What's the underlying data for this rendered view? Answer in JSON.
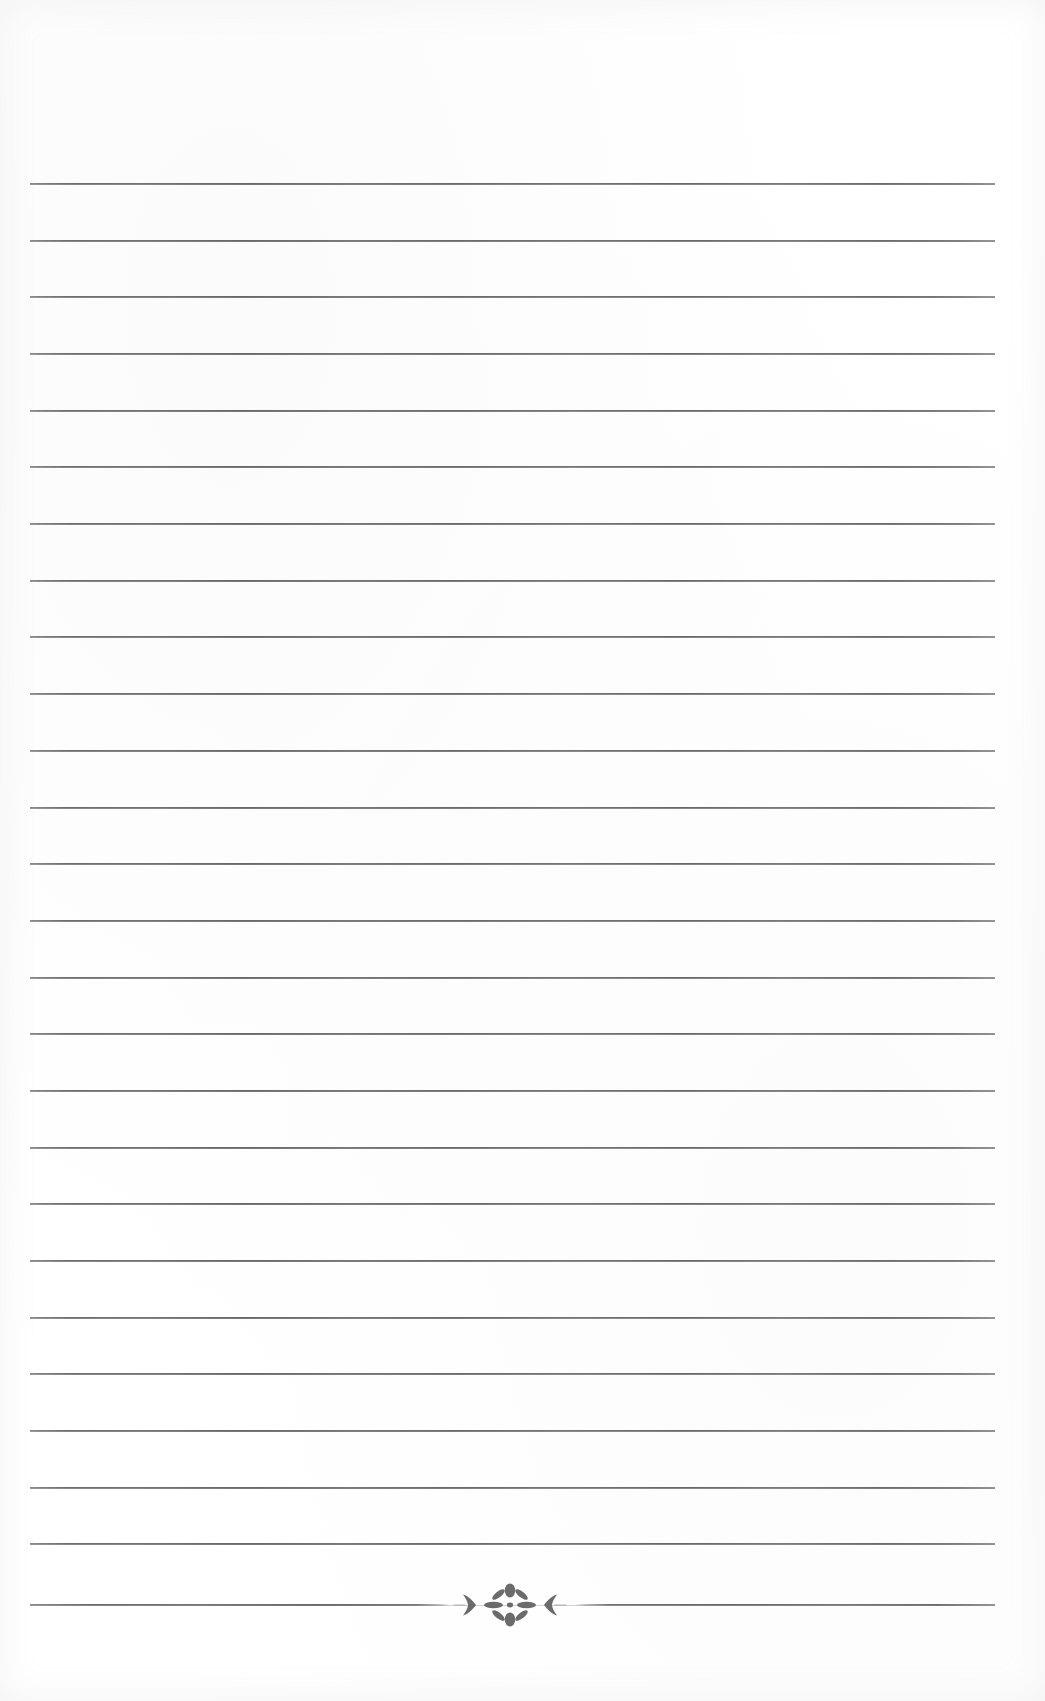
{
  "document": {
    "type": "lined-writing-paper",
    "title": "Blank Lined Notebook Page",
    "page_width": 1045,
    "page_height": 1701,
    "background_color": "#ffffff",
    "paper_color": "#fefefe",
    "rule_color": "#5e5e5e",
    "ornament_color": "#6b6b6b"
  },
  "rules": {
    "count": 26,
    "left_x": 30,
    "right_x": 995,
    "length": 965,
    "first_y": 184,
    "spacing": 56.6,
    "thickness": 2,
    "y_positions": [
      184,
      241,
      297,
      354,
      411,
      467,
      524,
      581,
      637,
      694,
      751,
      808,
      864,
      921,
      978,
      1034,
      1091,
      1148,
      1204,
      1261,
      1318,
      1374,
      1431,
      1488,
      1544,
      1605
    ]
  },
  "ornament": {
    "name": "floral-rosette-divider",
    "description": "chevron arrow, eight-petal flower rosette, chevron arrow",
    "center_x": 510,
    "center_y": 1605,
    "width": 150,
    "height": 46,
    "on_rule_index": 25,
    "petal_count": 8,
    "color": "#6b6b6b"
  },
  "content": {
    "text_lines": [],
    "is_blank": true
  }
}
